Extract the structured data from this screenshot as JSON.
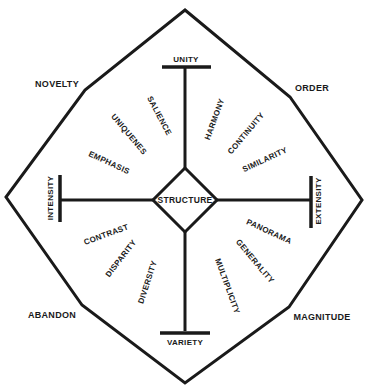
{
  "diagram": {
    "colors": {
      "ink": "#1a1a1a",
      "background": "#ffffff"
    },
    "center": {
      "label": "STRUCTURE"
    },
    "axes": {
      "top": "UNITY",
      "bottom": "VARIETY",
      "left": "INTENSITY",
      "right": "EXTENSITY"
    },
    "corners": {
      "top_left": "NOVELTY",
      "top_right": "ORDER",
      "bottom_left": "ABANDON",
      "bottom_right": "MAGNITUDE"
    },
    "quadrants": {
      "top_left": [
        "SALIENCE",
        "UNIQUENES",
        "EMPHASIS"
      ],
      "top_right": [
        "HARMONY",
        "CONTINUITY",
        "SIMILARITY"
      ],
      "bottom_left": [
        "CONTRAST",
        "DISPARITY",
        "DIVERSITY"
      ],
      "bottom_right": [
        "PANORAMA",
        "GENERALITY",
        "MULTIPLICITY"
      ]
    }
  }
}
